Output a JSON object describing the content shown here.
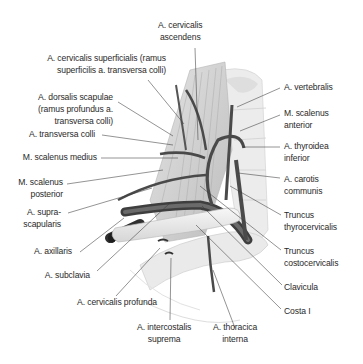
{
  "figure": {
    "labels": {
      "cervicalis_ascendens": [
        "A. cervicalis",
        "ascendens"
      ],
      "cervicalis_superficialis": [
        "A. cervicalis superficialis (ramus",
        "superficilis a. transversa colli)"
      ],
      "dorsalis_scapulae": [
        "A. dorsalis scapulae",
        "(ramus profundus a.",
        "transversa colli)"
      ],
      "transversa_colli": [
        "A. transversa colli"
      ],
      "scalenus_medius": [
        "M. scalenus medius"
      ],
      "scalenus_posterior": [
        "M. scalenus",
        "posterior"
      ],
      "suprascapularis": [
        "A. supra-",
        "scapularis"
      ],
      "axillaris": [
        "A. axillaris"
      ],
      "subclavia": [
        "A. subclavia"
      ],
      "cervicalis_profunda": [
        "A. cervicalis profunda"
      ],
      "intercostalis_suprema": [
        "A. intercostalis",
        "suprema"
      ],
      "thoracica_interna": [
        "A. thoracica",
        "interna"
      ],
      "vertebralis": [
        "A. vertebralis"
      ],
      "scalenus_anterior": [
        "M. scalenus",
        "anterior"
      ],
      "thyroidea_inferior": [
        "A. thyroidea",
        "inferior"
      ],
      "carotis_communis": [
        "A. carotis",
        "communis"
      ],
      "truncus_thyrocervicalis": [
        "Truncus",
        "thyrocervicalis"
      ],
      "truncus_costocervicalis": [
        "Truncus",
        "costocervicalis"
      ],
      "clavicula": [
        "Clavicula"
      ],
      "costa_i": [
        "Costa I"
      ]
    },
    "colors": {
      "artery": "#4a4a4a",
      "muscle": "#d8d8d8",
      "bone": "#eeeeee",
      "leader_line": "#3a3a3a",
      "text": "#2a2a2a"
    }
  }
}
